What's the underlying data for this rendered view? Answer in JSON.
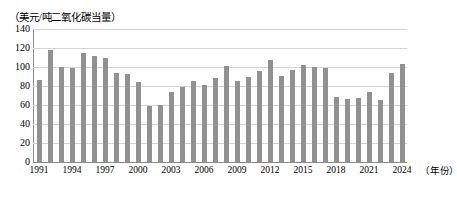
{
  "chart_data": {
    "type": "bar",
    "title": "",
    "unit_caption": "（美元/吨二氧化碳当量）",
    "xlabel": "（年份）",
    "ylabel": "",
    "ylim": [
      0,
      140
    ],
    "ytick_step": 20,
    "grid": true,
    "legend": "none",
    "bar_color": "#919191",
    "grid_color": "#d3d3d3",
    "axis_color": "#8a8a8a",
    "ytick_labels": [
      "140",
      "120",
      "100",
      "80",
      "60",
      "40",
      "20",
      "0"
    ],
    "ytick_values": [
      140,
      120,
      100,
      80,
      60,
      40,
      20,
      0
    ],
    "xtick_labels": [
      "1991",
      "1994",
      "1997",
      "2000",
      "2003",
      "2006",
      "2009",
      "2012",
      "2015",
      "2018",
      "2021",
      "2024"
    ],
    "xtick_years": [
      1991,
      1994,
      1997,
      2000,
      2003,
      2006,
      2009,
      2012,
      2015,
      2018,
      2021,
      2024
    ],
    "categories": [
      "1991",
      "1992",
      "1993",
      "1994",
      "1995",
      "1996",
      "1997",
      "1998",
      "1999",
      "2000",
      "2001",
      "2002",
      "2003",
      "2004",
      "2005",
      "2006",
      "2007",
      "2008",
      "2009",
      "2010",
      "2011",
      "2012",
      "2013",
      "2014",
      "2015",
      "2016",
      "2017",
      "2018",
      "2019",
      "2020",
      "2021",
      "2022",
      "2023",
      "2024"
    ],
    "values": [
      86,
      118,
      100,
      99,
      115,
      112,
      109,
      94,
      93,
      84,
      59,
      60,
      74,
      79,
      85,
      81,
      88,
      101,
      85,
      90,
      96,
      107,
      91,
      97,
      102,
      100,
      99,
      68,
      66,
      67,
      74,
      65,
      94,
      103
    ]
  }
}
